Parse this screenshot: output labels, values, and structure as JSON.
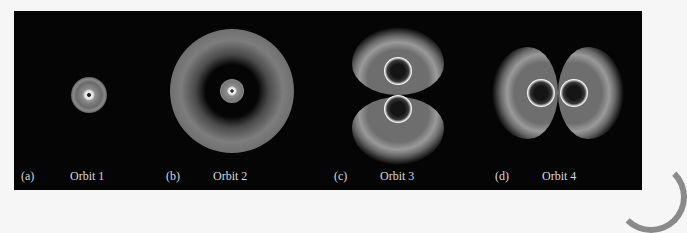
{
  "figure": {
    "panels": [
      {
        "letter": "(a)",
        "title": "Orbit 1",
        "description": "small spherical glow with bright central point"
      },
      {
        "letter": "(b)",
        "title": "Orbit 2",
        "description": "central bright disk surrounded by dark node and wide outer halo"
      },
      {
        "letter": "(c)",
        "title": "Orbit 3",
        "description": "two vertically stacked lobes with bright rings"
      },
      {
        "letter": "(d)",
        "title": "Orbit 4",
        "description": "two horizontally adjacent lobes with bright rings"
      }
    ],
    "colors": {
      "background": "#050505",
      "glow": "#9a9a9a",
      "ring": "#f0f0f0",
      "label": "#d8d8d8"
    }
  }
}
